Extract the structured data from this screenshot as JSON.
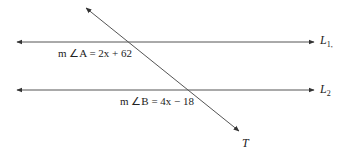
{
  "diagram": {
    "lines": {
      "L1": {
        "name": "L",
        "subscript": "1",
        "trailing": ","
      },
      "L2": {
        "name": "L",
        "subscript": "2"
      },
      "transversal": {
        "name": "T"
      }
    },
    "angles": {
      "A": {
        "label": "m ∠A = 2x + 62"
      },
      "B": {
        "label": "m ∠B = 4x − 18"
      }
    },
    "colors": {
      "line": "#555555",
      "text": "#222222"
    }
  }
}
